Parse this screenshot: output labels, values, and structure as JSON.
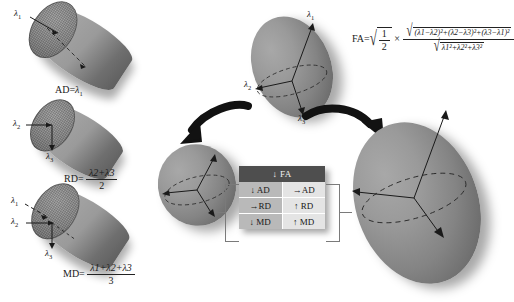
{
  "figure": {
    "domain": "diffusion-tensor-imaging-diagram"
  },
  "left_column": {
    "ad_panel": {
      "axis_labels": [
        {
          "name": "lambda-1",
          "text": "λ",
          "sub": "1"
        }
      ],
      "caption_prefix": "AD=",
      "caption_value": "λ",
      "caption_sub": "1",
      "caption_full": "AD=λ1"
    },
    "rd_panel": {
      "axis_labels": [
        {
          "name": "lambda-2",
          "text": "λ",
          "sub": "2"
        },
        {
          "name": "lambda-3",
          "text": "λ",
          "sub": "3"
        }
      ],
      "caption_prefix": "RD=",
      "numerator": "λ2+λ3",
      "denominator": "2",
      "caption_full": "RD=(λ2+λ3)/2"
    },
    "md_panel": {
      "axis_labels": [
        {
          "name": "lambda-1",
          "text": "λ",
          "sub": "1"
        },
        {
          "name": "lambda-2",
          "text": "λ",
          "sub": "2"
        },
        {
          "name": "lambda-3",
          "text": "λ",
          "sub": "3"
        }
      ],
      "caption_prefix": "MD=",
      "numerator": "λ1+λ2+λ3",
      "denominator": "3",
      "caption_full": "MD=(λ1+λ2+λ3)/3"
    }
  },
  "center_ellipsoid": {
    "name": "anisotropic-tensor-ellipsoid",
    "axis_labels": [
      {
        "name": "lambda-1",
        "text": "λ",
        "sub": "1"
      },
      {
        "name": "lambda-2",
        "text": "λ",
        "sub": "2"
      },
      {
        "name": "lambda-3",
        "text": "λ",
        "sub": "3"
      }
    ]
  },
  "fa_formula": {
    "lhs": "FA=",
    "sqrt_num": "1",
    "sqrt_den": "2",
    "times": "×",
    "numerator": "(λ1−λ2)²+(λ2−λ3)²+(λ3−λ1)²",
    "denominator": "λ1²+λ2²+λ3²",
    "full": "FA = √(1/2) × √[(λ1−λ2)²+(λ2−λ3)²+(λ3−λ1)²] / √(λ1²+λ2²+λ3²)"
  },
  "isotropic_ellipsoid": {
    "name": "isotropic-small-ellipsoid",
    "label": ""
  },
  "large_ellipsoid": {
    "name": "enlarged-tensor-ellipsoid",
    "label": ""
  },
  "comparison_table": {
    "header": "↓ FA",
    "rows": [
      {
        "left": "↓ AD",
        "right": "→AD"
      },
      {
        "left": "→RD",
        "right": "↑ RD"
      },
      {
        "left": "↓ MD",
        "right": "↑ MD"
      }
    ]
  },
  "arrows": {
    "left_arrow": "curved-arrow-to-isotropic-ellipsoid",
    "right_arrow": "curved-arrow-to-large-ellipsoid"
  },
  "colors": {
    "shape_fill": "#8e8e8e",
    "table_header_bg": "#4e4e4e",
    "table_cell_dark": "#b9b9b9",
    "table_cell_light": "#e4e4e4",
    "stroke": "#1a1a1a"
  }
}
